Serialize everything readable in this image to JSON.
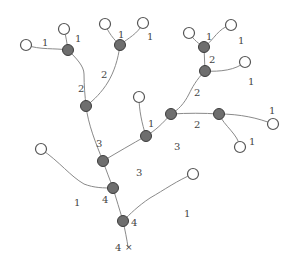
{
  "diagram": {
    "type": "tree",
    "colors": {
      "edge": "#8a8a8a",
      "leaf_fill": "#ffffff",
      "internal_fill": "#6e6e6e",
      "label": "#444444"
    },
    "nodes": [
      {
        "id": "A",
        "kind": "leaf",
        "x": 26,
        "y": 45
      },
      {
        "id": "B",
        "kind": "leaf",
        "x": 64,
        "y": 29
      },
      {
        "id": "N1",
        "kind": "internal",
        "x": 68,
        "y": 50
      },
      {
        "id": "C",
        "kind": "leaf",
        "x": 105,
        "y": 24
      },
      {
        "id": "D",
        "kind": "leaf",
        "x": 143,
        "y": 23
      },
      {
        "id": "N2",
        "kind": "internal",
        "x": 120,
        "y": 45
      },
      {
        "id": "N3",
        "kind": "internal",
        "x": 86,
        "y": 106
      },
      {
        "id": "E",
        "kind": "leaf",
        "x": 139,
        "y": 97
      },
      {
        "id": "N4",
        "kind": "internal",
        "x": 146,
        "y": 136
      },
      {
        "id": "F",
        "kind": "leaf",
        "x": 189,
        "y": 33
      },
      {
        "id": "G",
        "kind": "leaf",
        "x": 231,
        "y": 25
      },
      {
        "id": "N5",
        "kind": "internal",
        "x": 204,
        "y": 47
      },
      {
        "id": "N6",
        "kind": "internal",
        "x": 205,
        "y": 71
      },
      {
        "id": "H",
        "kind": "leaf",
        "x": 245,
        "y": 62
      },
      {
        "id": "N7",
        "kind": "internal",
        "x": 171,
        "y": 114
      },
      {
        "id": "N8",
        "kind": "internal",
        "x": 219,
        "y": 114
      },
      {
        "id": "I",
        "kind": "leaf",
        "x": 273,
        "y": 124
      },
      {
        "id": "J",
        "kind": "leaf",
        "x": 240,
        "y": 147
      },
      {
        "id": "N9",
        "kind": "internal",
        "x": 103,
        "y": 161
      },
      {
        "id": "K",
        "kind": "leaf",
        "x": 41,
        "y": 149
      },
      {
        "id": "N10",
        "kind": "internal",
        "x": 113,
        "y": 188
      },
      {
        "id": "L",
        "kind": "leaf",
        "x": 193,
        "y": 174
      },
      {
        "id": "N11",
        "kind": "internal",
        "x": 123,
        "y": 221
      },
      {
        "id": "ROOT",
        "kind": "outlet",
        "x": 128,
        "y": 247
      }
    ],
    "edges": [
      {
        "from": "A",
        "to": "N1",
        "order": 1
      },
      {
        "from": "B",
        "to": "N1",
        "order": 1
      },
      {
        "from": "C",
        "to": "N2",
        "order": 1
      },
      {
        "from": "D",
        "to": "N2",
        "order": 1
      },
      {
        "from": "N1",
        "to": "N3",
        "order": 2
      },
      {
        "from": "N2",
        "to": "N3",
        "order": 2
      },
      {
        "from": "F",
        "to": "N5",
        "order": 1
      },
      {
        "from": "G",
        "to": "N5",
        "order": 1
      },
      {
        "from": "N5",
        "to": "N6",
        "order": 2
      },
      {
        "from": "H",
        "to": "N6",
        "order": 1
      },
      {
        "from": "N6",
        "to": "N7",
        "order": 2
      },
      {
        "from": "I",
        "to": "N8",
        "order": 1
      },
      {
        "from": "J",
        "to": "N8",
        "order": 1
      },
      {
        "from": "N8",
        "to": "N7",
        "order": 2
      },
      {
        "from": "N7",
        "to": "N4",
        "order": 3
      },
      {
        "from": "E",
        "to": "N4",
        "order": 1
      },
      {
        "from": "N4",
        "to": "N9",
        "order": 3
      },
      {
        "from": "N3",
        "to": "N9",
        "order": 3
      },
      {
        "from": "N9",
        "to": "N10",
        "order": 4
      },
      {
        "from": "K",
        "to": "N10",
        "order": 1
      },
      {
        "from": "N10",
        "to": "N11",
        "order": 4
      },
      {
        "from": "L",
        "to": "N11",
        "order": 1
      },
      {
        "from": "N11",
        "to": "ROOT",
        "order": 4
      }
    ],
    "labels": [
      {
        "text": "1",
        "x": 42,
        "y": 46
      },
      {
        "text": "1",
        "x": 75,
        "y": 42
      },
      {
        "text": "1",
        "x": 118,
        "y": 38
      },
      {
        "text": "1",
        "x": 147,
        "y": 40
      },
      {
        "text": "2",
        "x": 101,
        "y": 78
      },
      {
        "text": "2",
        "x": 78,
        "y": 92
      },
      {
        "text": "1",
        "x": 206,
        "y": 40
      },
      {
        "text": "1",
        "x": 238,
        "y": 44
      },
      {
        "text": "2",
        "x": 209,
        "y": 63
      },
      {
        "text": "1",
        "x": 248,
        "y": 85
      },
      {
        "text": "2",
        "x": 194,
        "y": 96
      },
      {
        "text": "1",
        "x": 148,
        "y": 127
      },
      {
        "text": "2",
        "x": 194,
        "y": 128
      },
      {
        "text": "3",
        "x": 174,
        "y": 150
      },
      {
        "text": "1",
        "x": 269,
        "y": 114
      },
      {
        "text": "1",
        "x": 249,
        "y": 145
      },
      {
        "text": "3",
        "x": 96,
        "y": 147
      },
      {
        "text": "3",
        "x": 136,
        "y": 176
      },
      {
        "text": "1",
        "x": 74,
        "y": 206
      },
      {
        "text": "4",
        "x": 102,
        "y": 203
      },
      {
        "text": "4",
        "x": 131,
        "y": 226
      },
      {
        "text": "1",
        "x": 184,
        "y": 217
      },
      {
        "text": "4",
        "x": 115,
        "y": 251
      }
    ],
    "root_marker": "×"
  }
}
